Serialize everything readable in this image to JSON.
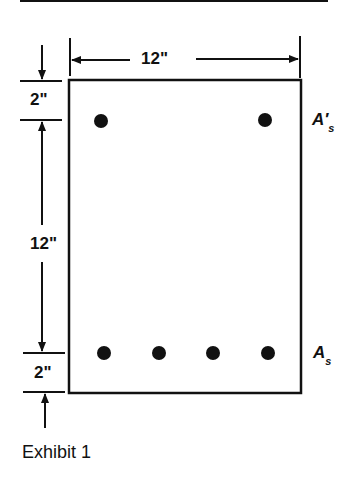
{
  "figure": {
    "caption": "Exhibit 1",
    "dimensions": {
      "width": "12\"",
      "top_cover": "2\"",
      "bar_spacing_depth": "12\"",
      "bottom_cover": "2\""
    },
    "labels": {
      "compression_steel": {
        "base": "A′",
        "sub": "s"
      },
      "tension_steel": {
        "base": "A",
        "sub": "s"
      }
    },
    "bars": {
      "top_row_count": 2,
      "bottom_row_count": 4
    },
    "colors": {
      "ink": "#111111",
      "background": "#ffffff"
    }
  }
}
